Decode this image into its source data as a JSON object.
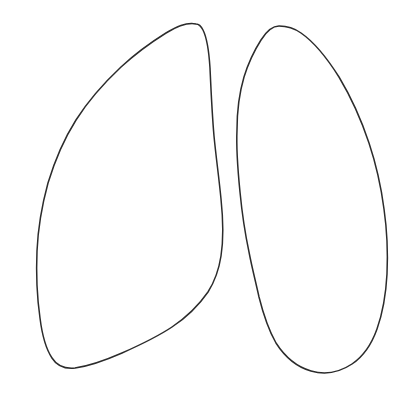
{
  "figure": {
    "style": "hand-drawn ink outline with stippled bronchovascular markings",
    "background_color": "#ffffff",
    "outline_color": "#2b2b2b",
    "outline_width_px": 1.5,
    "stipple_color_dark": "#1a1a1a",
    "stipple_color_mid": "#666666",
    "stipple_color_light": "#aaaaaa",
    "canvas": {
      "width": 417,
      "height": 396
    },
    "labels": [],
    "annotations": []
  },
  "chart_data": {
    "type": "scatter",
    "xlabel": "",
    "ylabel": "",
    "xlim": [
      0,
      417
    ],
    "ylim": [
      0,
      396
    ],
    "grid": false,
    "legend": "none",
    "series": [
      {
        "name": "left-lung-outline",
        "kind": "closed-path",
        "path": "M 196 24 C 186 22 176 27 166 33 C 150 43 134 55 121 67 C 104 83 88 101 76 120 C 64 139 55 160 48 183 C 42 205 38 228 37 251 C 36 274 37 297 40 318 C 42 334 46 349 52 358 C 57 366 65 369 75 368 C 90 366 106 360 122 353 C 140 345 157 337 172 327 C 187 317 199 305 208 292 C 215 281 219 269 221 256 C 224 237 223 218 221 199 C 219 178 216 157 214 136 C 212 113 211 90 210 68 C 209 52 207 38 203 30 C 201 26 199 24 196 24 Z"
      },
      {
        "name": "right-lung-outline",
        "kind": "closed-path",
        "path": "M 279 26 C 272 26 266 32 261 40 C 254 51 248 64 244 77 C 239 94 237 112 237 130 C 236 151 238 172 240 192 C 242 213 245 233 249 252 C 252 268 256 283 259 297 C 263 313 268 329 276 343 C 285 357 297 367 311 371 C 325 375 340 372 352 364 C 364 356 372 343 377 329 C 383 312 386 293 387 274 C 388 252 387 230 384 209 C 381 186 376 164 369 143 C 361 119 351 97 339 77 C 327 58 314 42 301 33 C 294 28 286 26 279 26 Z"
      },
      {
        "name": "left-hilum-dense",
        "kind": "stipple-cluster",
        "center": [
          196,
          180
        ],
        "density": "high",
        "color": "#1a1a1a"
      },
      {
        "name": "right-hilum-dense",
        "kind": "stipple-cluster",
        "center": [
          247,
          186
        ],
        "density": "high",
        "color": "#1a1a1a"
      },
      {
        "name": "left-bronchovascular-markings",
        "kind": "radiating-stipple",
        "origin": [
          198,
          180
        ],
        "spread_deg": [
          120,
          260
        ],
        "density": "medium"
      },
      {
        "name": "right-bronchovascular-markings",
        "kind": "radiating-stipple",
        "origin": [
          248,
          186
        ],
        "spread_deg": [
          -40,
          90
        ],
        "density": "medium"
      }
    ]
  }
}
